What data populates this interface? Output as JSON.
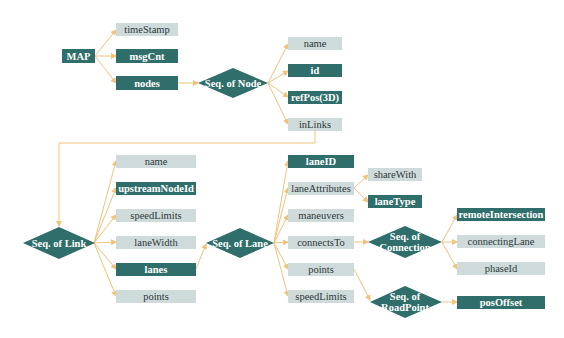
{
  "diagram": {
    "colors": {
      "dark_node": "#2f6e6a",
      "light_node": "#cfdbdb",
      "connector": "#f0c27a",
      "background": "#ffffff"
    },
    "nodes": {
      "map": {
        "label": "MAP",
        "style": "dark"
      },
      "timeStamp": {
        "label": "timeStamp",
        "style": "light"
      },
      "msgCnt": {
        "label": "msgCnt",
        "style": "dark"
      },
      "nodes": {
        "label": "nodes",
        "style": "dark"
      },
      "seqNode": {
        "label": "Seq. of Node",
        "shape": "diamond"
      },
      "nodeName": {
        "label": "name",
        "style": "light"
      },
      "nodeId": {
        "label": "id",
        "style": "dark"
      },
      "refPos": {
        "label": "refPos(3D)",
        "style": "dark"
      },
      "inLinks": {
        "label": "inLinks",
        "style": "light"
      },
      "seqLink": {
        "label": "Seq. of Link",
        "shape": "diamond"
      },
      "linkName": {
        "label": "name",
        "style": "light"
      },
      "upstreamNodeId": {
        "label": "upstreamNodeId",
        "style": "dark"
      },
      "linkSpeedLimits": {
        "label": "speedLimits",
        "style": "light"
      },
      "laneWidth": {
        "label": "laneWidth",
        "style": "light"
      },
      "lanes": {
        "label": "lanes",
        "style": "dark"
      },
      "linkPoints": {
        "label": "points",
        "style": "light"
      },
      "seqLane": {
        "label": "Seq. of Lane",
        "shape": "diamond"
      },
      "laneID": {
        "label": "laneID",
        "style": "dark"
      },
      "laneAttributes": {
        "label": "laneAttributes",
        "style": "light"
      },
      "maneuvers": {
        "label": "maneuvers",
        "style": "light"
      },
      "connectsTo": {
        "label": "connectsTo",
        "style": "light"
      },
      "lanePoints": {
        "label": "points",
        "style": "light"
      },
      "laneSpeedLimits": {
        "label": "speedLimits",
        "style": "light"
      },
      "shareWith": {
        "label": "shareWith",
        "style": "light"
      },
      "laneType": {
        "label": "laneType",
        "style": "dark"
      },
      "seqConnection": {
        "line1": "Seq. of",
        "line2": "Connection",
        "shape": "diamond"
      },
      "remoteIntersection": {
        "label": "remoteIntersection",
        "style": "dark"
      },
      "connectingLane": {
        "label": "connectingLane",
        "style": "light"
      },
      "phaseId": {
        "label": "phaseId",
        "style": "light"
      },
      "seqRoadPoint": {
        "line1": "Seq. of",
        "line2": "RoadPoint",
        "shape": "diamond"
      },
      "posOffset": {
        "label": "posOffset",
        "style": "dark"
      }
    },
    "edges": [
      [
        "MAP",
        "timeStamp"
      ],
      [
        "MAP",
        "msgCnt"
      ],
      [
        "MAP",
        "nodes"
      ],
      [
        "nodes",
        "Seq. of Node"
      ],
      [
        "Seq. of Node",
        "name"
      ],
      [
        "Seq. of Node",
        "id"
      ],
      [
        "Seq. of Node",
        "refPos(3D)"
      ],
      [
        "Seq. of Node",
        "inLinks"
      ],
      [
        "inLinks",
        "Seq. of Link"
      ],
      [
        "Seq. of Link",
        "name"
      ],
      [
        "Seq. of Link",
        "upstreamNodeId"
      ],
      [
        "Seq. of Link",
        "speedLimits"
      ],
      [
        "Seq. of Link",
        "laneWidth"
      ],
      [
        "Seq. of Link",
        "lanes"
      ],
      [
        "Seq. of Link",
        "points"
      ],
      [
        "lanes",
        "Seq. of Lane"
      ],
      [
        "Seq. of Lane",
        "laneID"
      ],
      [
        "Seq. of Lane",
        "laneAttributes"
      ],
      [
        "Seq. of Lane",
        "maneuvers"
      ],
      [
        "Seq. of Lane",
        "connectsTo"
      ],
      [
        "Seq. of Lane",
        "points"
      ],
      [
        "Seq. of Lane",
        "speedLimits"
      ],
      [
        "laneAttributes",
        "shareWith"
      ],
      [
        "laneAttributes",
        "laneType"
      ],
      [
        "connectsTo",
        "Seq. of Connection"
      ],
      [
        "Seq. of Connection",
        "remoteIntersection"
      ],
      [
        "Seq. of Connection",
        "connectingLane"
      ],
      [
        "Seq. of Connection",
        "phaseId"
      ],
      [
        "points",
        "Seq. of RoadPoint"
      ],
      [
        "Seq. of RoadPoint",
        "posOffset"
      ]
    ]
  }
}
